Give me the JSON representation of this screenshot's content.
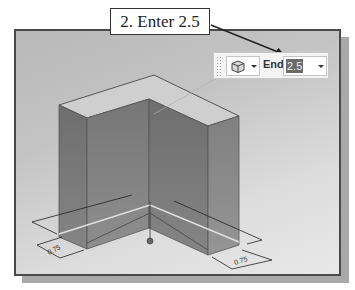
{
  "callout": {
    "text": "2. Enter 2.5"
  },
  "toolbar": {
    "shape_icon": "extrude-solid-icon",
    "depth_label": "End",
    "depth_value": "2.5"
  },
  "viewport": {
    "dimensions": [
      "0.75",
      "0.75"
    ],
    "colors": {
      "background_top": "#b8b8b8",
      "background_bottom": "#e8e8e8",
      "solid_face": "#7a7a7a",
      "top_face": "#c8c8c8"
    }
  }
}
